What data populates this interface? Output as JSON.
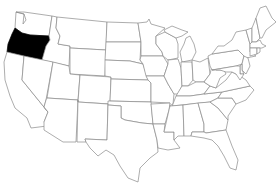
{
  "map": {
    "title": "United States",
    "highlighted_state": "Oregon",
    "highlight_color": "#000000",
    "default_fill": "#ffffff",
    "border_color": "#8a8a8a",
    "states": [
      {
        "id": "WA",
        "name": "Washington"
      },
      {
        "id": "OR",
        "name": "Oregon",
        "highlighted": true
      },
      {
        "id": "CA",
        "name": "California"
      },
      {
        "id": "ID",
        "name": "Idaho"
      },
      {
        "id": "NV",
        "name": "Nevada"
      },
      {
        "id": "MT",
        "name": "Montana"
      },
      {
        "id": "WY",
        "name": "Wyoming"
      },
      {
        "id": "UT",
        "name": "Utah"
      },
      {
        "id": "AZ",
        "name": "Arizona"
      },
      {
        "id": "CO",
        "name": "Colorado"
      },
      {
        "id": "NM",
        "name": "New Mexico"
      },
      {
        "id": "ND",
        "name": "North Dakota"
      },
      {
        "id": "SD",
        "name": "South Dakota"
      },
      {
        "id": "NE",
        "name": "Nebraska"
      },
      {
        "id": "KS",
        "name": "Kansas"
      },
      {
        "id": "OK",
        "name": "Oklahoma"
      },
      {
        "id": "TX",
        "name": "Texas"
      },
      {
        "id": "MN",
        "name": "Minnesota"
      },
      {
        "id": "IA",
        "name": "Iowa"
      },
      {
        "id": "MO",
        "name": "Missouri"
      },
      {
        "id": "AR",
        "name": "Arkansas"
      },
      {
        "id": "LA",
        "name": "Louisiana"
      },
      {
        "id": "WI",
        "name": "Wisconsin"
      },
      {
        "id": "IL",
        "name": "Illinois"
      },
      {
        "id": "MI",
        "name": "Michigan"
      },
      {
        "id": "IN",
        "name": "Indiana"
      },
      {
        "id": "OH",
        "name": "Ohio"
      },
      {
        "id": "KY",
        "name": "Kentucky"
      },
      {
        "id": "TN",
        "name": "Tennessee"
      },
      {
        "id": "MS",
        "name": "Mississippi"
      },
      {
        "id": "AL",
        "name": "Alabama"
      },
      {
        "id": "GA",
        "name": "Georgia"
      },
      {
        "id": "FL",
        "name": "Florida"
      },
      {
        "id": "SC",
        "name": "South Carolina"
      },
      {
        "id": "NC",
        "name": "North Carolina"
      },
      {
        "id": "VA",
        "name": "Virginia"
      },
      {
        "id": "WV",
        "name": "West Virginia"
      },
      {
        "id": "PA",
        "name": "Pennsylvania"
      },
      {
        "id": "NY",
        "name": "New York"
      },
      {
        "id": "VT",
        "name": "Vermont"
      },
      {
        "id": "NH",
        "name": "New Hampshire"
      },
      {
        "id": "ME",
        "name": "Maine"
      },
      {
        "id": "MA",
        "name": "Massachusetts"
      },
      {
        "id": "CT",
        "name": "Connecticut"
      },
      {
        "id": "RI",
        "name": "Rhode Island"
      },
      {
        "id": "NJ",
        "name": "New Jersey"
      },
      {
        "id": "DE",
        "name": "Delaware"
      },
      {
        "id": "MD",
        "name": "Maryland"
      }
    ]
  }
}
